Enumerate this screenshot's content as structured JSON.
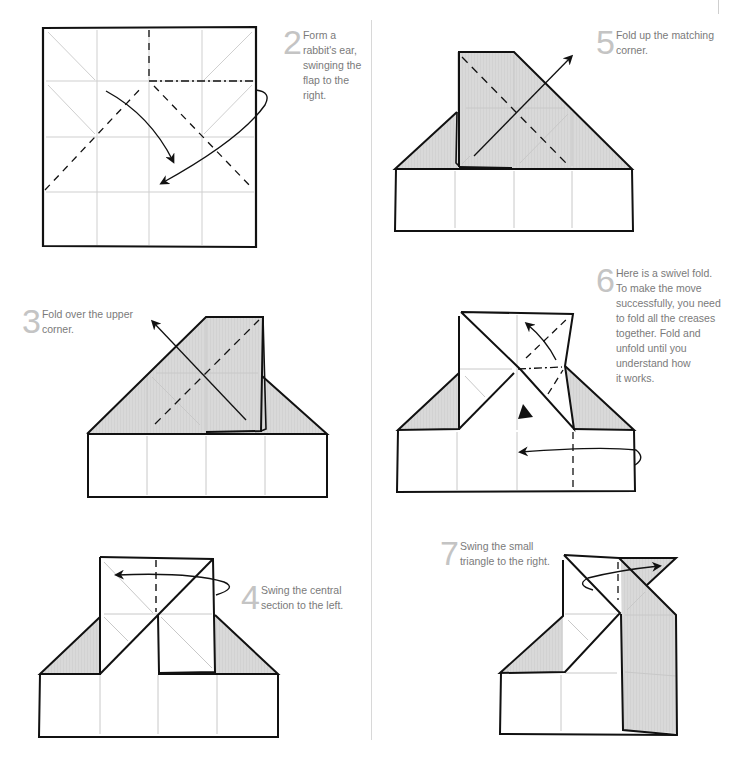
{
  "page": {
    "colors": {
      "paper_fill": "#d9d9d9",
      "outline": "#111111",
      "crease": "#c8c8c8",
      "step_number": "#c4c4c4",
      "caption_text": "#7a7a7a"
    }
  },
  "steps": [
    {
      "number": "2",
      "lines": [
        "Form a",
        "rabbit's ear,",
        "swinging the",
        "flap to the",
        "right."
      ]
    },
    {
      "number": "3",
      "lines": [
        "Fold over the upper",
        "corner."
      ]
    },
    {
      "number": "4",
      "lines": [
        "Swing the central",
        "section to the left."
      ]
    },
    {
      "number": "5",
      "lines": [
        "Fold up the matching",
        "corner."
      ]
    },
    {
      "number": "6",
      "lines": [
        "Here is a swivel fold.",
        "To make the move",
        "successfully, you need",
        "to fold all the creases",
        "together. Fold and",
        "unfold until you",
        "understand how",
        "it works."
      ]
    },
    {
      "number": "7",
      "lines": [
        "Swing the small",
        "triangle to the right."
      ]
    }
  ]
}
